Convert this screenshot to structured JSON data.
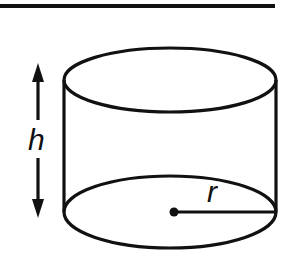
{
  "diagram": {
    "type": "cylinder",
    "labels": {
      "height": "h",
      "radius": "r"
    },
    "colors": {
      "stroke": "#111111",
      "background": "#ffffff"
    }
  }
}
